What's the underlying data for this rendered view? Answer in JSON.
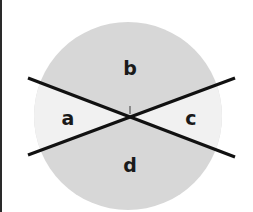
{
  "diagram": {
    "type": "circle divided by two intersecting lines",
    "labels": {
      "top": "b",
      "left": "a",
      "right": "c",
      "bottom": "d"
    },
    "colors": {
      "background": "#ffffff",
      "circle_fill": "#d7d7d7",
      "side_regions_fill": "#f1f1f1",
      "lines": "#111111",
      "left_border": "#2a2a2a",
      "tick_mark": "#8a8a8a"
    },
    "geometry": {
      "circle_center": [
        128,
        116
      ],
      "circle_radius": 94,
      "intersection": [
        130,
        117
      ],
      "line_1": {
        "from": [
          28,
          78
        ],
        "to": [
          235,
          157
        ]
      },
      "line_2": {
        "from": [
          28,
          155
        ],
        "to": [
          235,
          78
        ]
      }
    }
  }
}
